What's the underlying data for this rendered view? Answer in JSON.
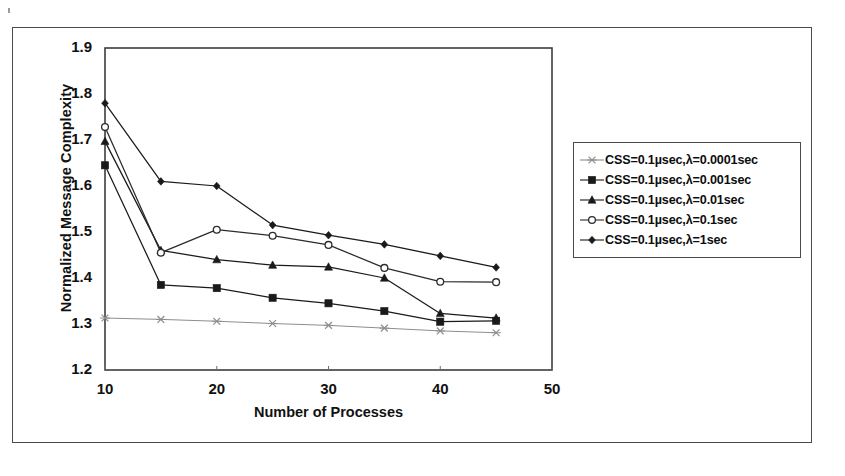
{
  "figure": {
    "frame_color": "#4a4a4a",
    "background": "#ffffff"
  },
  "chart_data": {
    "type": "line",
    "title": "",
    "xlabel": "Number of Processes",
    "ylabel": "Normalized Message Complexity",
    "x": [
      10,
      15,
      20,
      25,
      30,
      35,
      40,
      45
    ],
    "xlim": [
      10,
      50
    ],
    "ylim": [
      1.2,
      1.9
    ],
    "xticks": [
      10,
      20,
      30,
      40,
      50
    ],
    "xtick_labels": [
      "10",
      "20",
      "30",
      "40",
      "50"
    ],
    "yticks": [
      1.2,
      1.3,
      1.4,
      1.5,
      1.6,
      1.7,
      1.8,
      1.9
    ],
    "ytick_labels": [
      "1.2",
      "1.3",
      "1.4",
      "1.5",
      "1.6",
      "1.7",
      "1.8",
      "1.9"
    ],
    "grid": false,
    "legend_position": "right",
    "series": [
      {
        "name": "CSS=0.1µsec,λ=0.0001sec",
        "marker": "x-marker",
        "color": "#8d8d8d",
        "values": [
          1.313,
          1.31,
          1.306,
          1.301,
          1.297,
          1.291,
          1.285,
          1.281
        ]
      },
      {
        "name": "CSS=0.1µsec,λ=0.001sec",
        "marker": "filled-square",
        "color": "#1a1a1a",
        "values": [
          1.645,
          1.385,
          1.378,
          1.357,
          1.345,
          1.328,
          1.305,
          1.307
        ]
      },
      {
        "name": "CSS=0.1µsec,λ=0.01sec",
        "marker": "filled-triangle",
        "color": "#1a1a1a",
        "values": [
          1.697,
          1.46,
          1.44,
          1.428,
          1.424,
          1.4,
          1.323,
          1.313
        ]
      },
      {
        "name": "CSS=0.1µsec,λ=0.1sec",
        "marker": "open-circle",
        "color": "#2b2b2b",
        "values": [
          1.728,
          1.455,
          1.505,
          1.492,
          1.472,
          1.422,
          1.392,
          1.391
        ]
      },
      {
        "name": "CSS=0.1µsec,λ=1sec",
        "marker": "filled-diamond",
        "color": "#1a1a1a",
        "values": [
          1.78,
          1.61,
          1.6,
          1.515,
          1.493,
          1.473,
          1.448,
          1.423
        ]
      }
    ]
  },
  "legend": {
    "entries": [
      {
        "label": "CSS=0.1µsec,λ=0.0001sec",
        "marker": "x-marker"
      },
      {
        "label": "CSS=0.1µsec,λ=0.001sec",
        "marker": "filled-square"
      },
      {
        "label": "CSS=0.1µsec,λ=0.01sec",
        "marker": "filled-triangle"
      },
      {
        "label": "CSS=0.1µsec,λ=0.1sec",
        "marker": "open-circle"
      },
      {
        "label": "CSS=0.1µsec,λ=1sec",
        "marker": "filled-diamond"
      }
    ]
  }
}
